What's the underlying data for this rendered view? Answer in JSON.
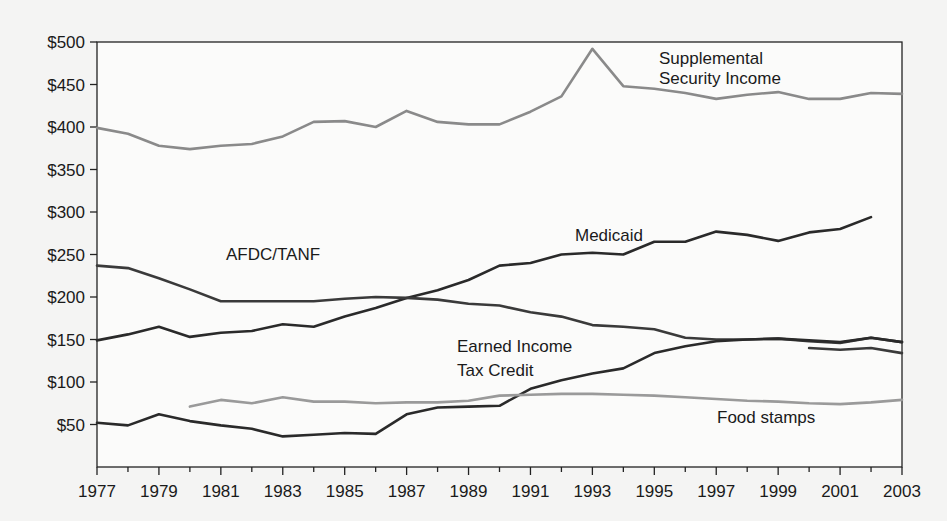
{
  "chart_data": {
    "type": "line",
    "title": "",
    "xlabel": "",
    "ylabel": "",
    "xlim": [
      1977,
      2003
    ],
    "ylim": [
      0,
      500
    ],
    "grid": false,
    "legend": "inline annotations",
    "x_ticks": [
      "1977",
      "1979",
      "1981",
      "1983",
      "1985",
      "1987",
      "1989",
      "1991",
      "1993",
      "1995",
      "1997",
      "1999",
      "2001",
      "2003"
    ],
    "y_ticks": [
      "$50",
      "$100",
      "$150",
      "$200",
      "$250",
      "$300",
      "$350",
      "$400",
      "$450",
      "$500"
    ],
    "x": [
      1977,
      1978,
      1979,
      1980,
      1981,
      1982,
      1983,
      1984,
      1985,
      1986,
      1987,
      1988,
      1989,
      1990,
      1991,
      1992,
      1993,
      1994,
      1995,
      1996,
      1997,
      1998,
      1999,
      2000,
      2001,
      2002,
      2003
    ],
    "series": [
      {
        "name": "Supplemental Security Income",
        "label_lines": [
          "Supplemental",
          "Security Income"
        ],
        "color": "#8a8a8a",
        "values": [
          399,
          392,
          378,
          374,
          378,
          380,
          389,
          406,
          407,
          400,
          419,
          406,
          403,
          403,
          418,
          436,
          492,
          448,
          445,
          440,
          433,
          438,
          441,
          433,
          433,
          440,
          439
        ]
      },
      {
        "name": "Medicaid",
        "label_lines": [
          "Medicaid"
        ],
        "color": "#2a2a2a",
        "values": [
          149,
          156,
          165,
          153,
          158,
          160,
          168,
          165,
          177,
          187,
          199,
          208,
          220,
          237,
          240,
          250,
          252,
          250,
          265,
          265,
          277,
          273,
          266,
          276,
          280,
          294,
          null
        ]
      },
      {
        "name": "AFDC/TANF",
        "label_lines": [
          "AFDC/TANF"
        ],
        "color": "#3a3a3a",
        "values": [
          237,
          234,
          222,
          209,
          195,
          195,
          195,
          195,
          198,
          200,
          199,
          197,
          192,
          190,
          182,
          177,
          167,
          165,
          162,
          152,
          150,
          150,
          151,
          148,
          146,
          152,
          147
        ]
      },
      {
        "name": "AFDC/TANF (revised)",
        "label_lines": [],
        "color": "#3a3a3a",
        "values": [
          null,
          null,
          null,
          null,
          null,
          null,
          null,
          null,
          null,
          null,
          null,
          null,
          null,
          null,
          null,
          null,
          null,
          null,
          null,
          null,
          null,
          null,
          null,
          140,
          138,
          140,
          134
        ]
      },
      {
        "name": "Earned Income Tax Credit",
        "label_lines": [
          "Earned Income",
          "Tax Credit"
        ],
        "color": "#2a2a2a",
        "values": [
          52,
          49,
          62,
          54,
          49,
          45,
          36,
          38,
          40,
          39,
          62,
          70,
          71,
          72,
          92,
          102,
          110,
          116,
          134,
          142,
          148,
          150,
          151,
          149,
          147,
          152,
          147
        ]
      },
      {
        "name": "Food stamps",
        "label_lines": [
          "Food stamps"
        ],
        "color": "#9a9a9a",
        "values": [
          null,
          null,
          null,
          71,
          79,
          75,
          82,
          77,
          77,
          75,
          76,
          76,
          78,
          84,
          85,
          86,
          86,
          85,
          84,
          82,
          80,
          78,
          77,
          75,
          74,
          76,
          79
        ]
      }
    ]
  }
}
